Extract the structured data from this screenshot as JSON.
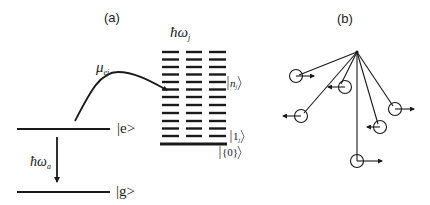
{
  "panels": {
    "a": {
      "label": "(a)",
      "levels": {
        "excited": {
          "label": "|e>"
        },
        "ground": {
          "label": "|g>"
        }
      },
      "transition": {
        "symbol": "ħω",
        "subscript": "a"
      },
      "coupling": {
        "symbol": "μ",
        "subscript": "ej"
      },
      "oscillator_bank": {
        "symbol": "ħω",
        "subscript": "j",
        "columns": 3,
        "rows": 12,
        "state_labels": [
          {
            "ket": "n",
            "subscript": "j"
          },
          {
            "ket": "1",
            "subscript": "j"
          },
          {
            "ket": "{0}",
            "subscript": ""
          }
        ]
      }
    },
    "b": {
      "label": "(b)",
      "description": "Coupled pendula hanging from a common pivot, each bob with a velocity arrow",
      "pendula": [
        {
          "bob": [
            296,
            76
          ],
          "arrow_dir": "right"
        },
        {
          "bob": [
            345,
            87
          ],
          "arrow_dir": "left"
        },
        {
          "bob": [
            301,
            116
          ],
          "arrow_dir": "left"
        },
        {
          "bob": [
            380,
            127
          ],
          "arrow_dir": "left"
        },
        {
          "bob": [
            395,
            109
          ],
          "arrow_dir": "right"
        },
        {
          "bob": [
            357,
            161
          ],
          "arrow_dir": "right"
        }
      ]
    }
  },
  "colors": {
    "ink": "#1a1a1a",
    "background": "#ffffff"
  }
}
